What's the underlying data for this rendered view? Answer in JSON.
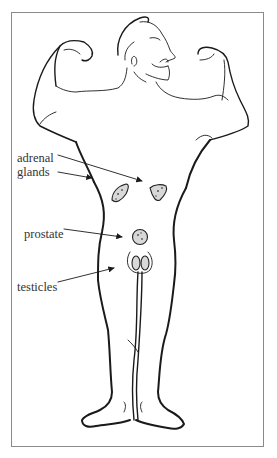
{
  "diagram": {
    "labels": {
      "adrenal_line1": "adrenal",
      "adrenal_line2": "glands",
      "prostate": "prostate",
      "testicles": "testicles"
    },
    "colors": {
      "ink": "#1a1a1a",
      "frame": "#8a8a8a",
      "label_text": "#333333",
      "gland_fill": "#d8d8d8"
    }
  }
}
